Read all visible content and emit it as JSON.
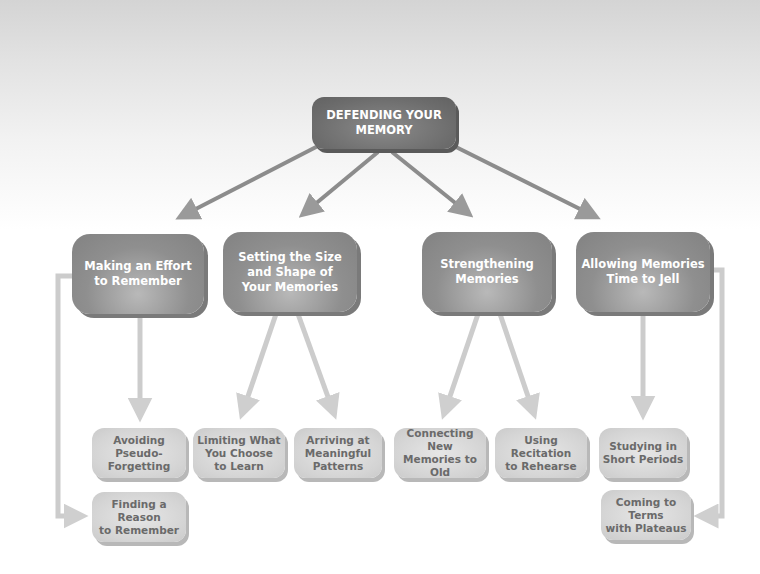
{
  "diagram": {
    "root": {
      "label": "DEFENDING YOUR\nMEMORY"
    },
    "branches": [
      {
        "label": "Making an Effort\nto Remember"
      },
      {
        "label": "Setting the Size\nand Shape of\nYour Memories"
      },
      {
        "label": "Strengthening\nMemories"
      },
      {
        "label": "Allowing Memories\nTime to Jell"
      }
    ],
    "leaves": [
      {
        "label": "Avoiding Pseudo-\nForgetting",
        "parent": 0
      },
      {
        "label": "Finding a Reason\nto Remember",
        "parent": 0
      },
      {
        "label": "Limiting What\nYou Choose\nto Learn",
        "parent": 1
      },
      {
        "label": "Arriving at\nMeaningful\nPatterns",
        "parent": 1
      },
      {
        "label": "Connecting New\nMemories to Old",
        "parent": 2
      },
      {
        "label": "Using Recitation\nto Rehearse",
        "parent": 2
      },
      {
        "label": "Studying in\nShort Periods",
        "parent": 3
      },
      {
        "label": "Coming to Terms\nwith Plateaus",
        "parent": 3
      }
    ],
    "colors": {
      "root_fill": "#6c6c6c",
      "branch_fill": "#8f8f8f",
      "leaf_fill": "#d4d4d4",
      "root_arrow": "#8c8c8c",
      "branch_arrow": "#cccccc",
      "leaf_text": "#6a6a6a"
    }
  }
}
